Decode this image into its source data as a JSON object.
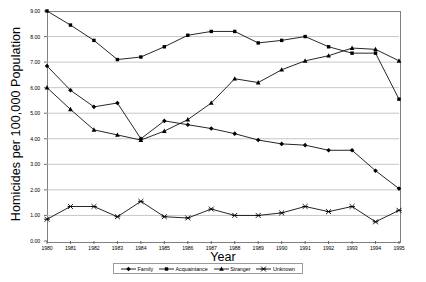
{
  "chart_data": {
    "type": "line",
    "title": "",
    "xlabel": "Year",
    "ylabel": "Homicides per 100,000 Population",
    "categories": [
      "1980",
      "1981",
      "1982",
      "1983",
      "1984",
      "1985",
      "1986",
      "1987",
      "1988",
      "1989",
      "1990",
      "1991",
      "1992",
      "1993",
      "1994",
      "1995"
    ],
    "x": [
      1980,
      1981,
      1982,
      1983,
      1984,
      1985,
      1986,
      1987,
      1988,
      1989,
      1990,
      1991,
      1992,
      1993,
      1994,
      1995
    ],
    "ylim": [
      0,
      9
    ],
    "xlim": [
      1980,
      1995
    ],
    "ytick_labels": [
      "0.00",
      "1.00",
      "2.00",
      "3.00",
      "4.00",
      "5.00",
      "6.00",
      "7.00",
      "8.00",
      "9.00"
    ],
    "ytick_values": [
      0,
      1,
      2,
      3,
      4,
      5,
      6,
      7,
      8,
      9
    ],
    "grid": true,
    "grid_axis": "y",
    "legend_position": "bottom",
    "series": [
      {
        "name": "Family",
        "marker": "diamond",
        "color": "#000000",
        "values": [
          6.85,
          5.9,
          5.25,
          5.4,
          4.0,
          4.7,
          4.55,
          4.4,
          4.2,
          3.95,
          3.8,
          3.75,
          3.55,
          3.55,
          2.75,
          2.05
        ]
      },
      {
        "name": "Acquaintance",
        "marker": "square",
        "color": "#000000",
        "values": [
          9.0,
          8.45,
          7.85,
          7.1,
          7.2,
          7.6,
          8.05,
          8.2,
          8.2,
          7.75,
          7.85,
          8.0,
          7.6,
          7.35,
          7.35,
          5.55
        ]
      },
      {
        "name": "Stranger",
        "marker": "triangle",
        "color": "#000000",
        "values": [
          6.0,
          5.15,
          4.35,
          4.15,
          3.95,
          4.3,
          4.75,
          5.4,
          6.35,
          6.2,
          6.7,
          7.05,
          7.25,
          7.55,
          7.5,
          7.05
        ]
      },
      {
        "name": "Unknown",
        "marker": "x-bar",
        "color": "#000000",
        "values": [
          0.85,
          1.35,
          1.35,
          0.95,
          1.55,
          0.95,
          0.9,
          1.25,
          1.0,
          1.0,
          1.1,
          1.35,
          1.15,
          1.35,
          0.75,
          1.2
        ]
      }
    ]
  },
  "axis": {
    "y_title": "Homicides per 100,000 Population",
    "x_title": "Year"
  },
  "colors": {
    "line": "#000000",
    "grid": "#b9b9b9",
    "frame": "#808080",
    "background": "#ffffff"
  }
}
